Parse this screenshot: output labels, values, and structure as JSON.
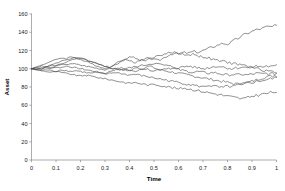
{
  "chart_data": {
    "type": "line",
    "title": "",
    "xlabel": "Time",
    "ylabel": "Asset",
    "xlim": [
      0,
      1
    ],
    "ylim": [
      0,
      160
    ],
    "grid": false,
    "legend": false,
    "x_ticks": [
      "0",
      "0.1",
      "0.2",
      "0.3",
      "0.4",
      "0.5",
      "0.6",
      "0.7",
      "0.8",
      "0.9",
      "1"
    ],
    "x_tick_values": [
      0,
      0.1,
      0.2,
      0.3,
      0.4,
      0.5,
      0.6,
      0.7,
      0.8,
      0.9,
      1
    ],
    "y_ticks": [
      "0",
      "20",
      "40",
      "60",
      "80",
      "100",
      "120",
      "140",
      "160"
    ],
    "y_tick_values": [
      0,
      20,
      40,
      60,
      80,
      100,
      120,
      140,
      160
    ],
    "line_color": "#4a4a4a",
    "x": [
      0,
      0.02,
      0.04,
      0.06,
      0.08,
      0.1,
      0.12,
      0.14,
      0.16,
      0.18,
      0.2,
      0.22,
      0.24,
      0.26,
      0.28,
      0.3,
      0.32,
      0.34,
      0.36,
      0.38,
      0.4,
      0.42,
      0.44,
      0.46,
      0.48,
      0.5,
      0.52,
      0.54,
      0.56,
      0.58,
      0.6,
      0.62,
      0.64,
      0.66,
      0.68,
      0.7,
      0.72,
      0.74,
      0.76,
      0.78,
      0.8,
      0.82,
      0.84,
      0.86,
      0.88,
      0.9,
      0.92,
      0.94,
      0.96,
      0.98,
      1
    ],
    "series": [
      {
        "name": "path-1",
        "values": [
          100,
          101,
          103,
          102,
          104,
          103,
          105,
          104,
          106,
          105,
          104,
          103,
          102,
          101,
          100,
          99,
          101,
          104,
          107,
          110,
          109,
          107,
          108,
          110,
          112,
          110,
          109,
          112,
          115,
          117,
          116,
          118,
          117,
          119,
          118,
          120,
          122,
          124,
          126,
          128,
          127,
          130,
          133,
          136,
          139,
          141,
          143,
          144,
          146,
          146,
          147
        ]
      },
      {
        "name": "path-2",
        "values": [
          100,
          102,
          104,
          106,
          108,
          110,
          112,
          111,
          113,
          112,
          110,
          108,
          106,
          104,
          102,
          100,
          102,
          105,
          108,
          111,
          113,
          112,
          110,
          109,
          111,
          113,
          114,
          116,
          117,
          118,
          117,
          116,
          115,
          116,
          114,
          113,
          112,
          110,
          109,
          108,
          107,
          106,
          105,
          104,
          103,
          101,
          100,
          99,
          98,
          97,
          96
        ]
      },
      {
        "name": "path-3",
        "values": [
          100,
          101,
          100,
          102,
          104,
          106,
          108,
          110,
          111,
          112,
          111,
          110,
          108,
          106,
          104,
          102,
          101,
          100,
          99,
          100,
          101,
          102,
          103,
          104,
          105,
          106,
          105,
          104,
          103,
          102,
          101,
          102,
          103,
          102,
          101,
          100,
          101,
          102,
          103,
          102,
          101,
          100,
          101,
          102,
          101,
          102,
          103,
          102,
          103,
          102,
          103
        ]
      },
      {
        "name": "path-4",
        "values": [
          100,
          100,
          101,
          102,
          101,
          103,
          105,
          107,
          109,
          111,
          112,
          110,
          108,
          107,
          105,
          103,
          101,
          100,
          99,
          98,
          99,
          100,
          101,
          100,
          99,
          98,
          99,
          100,
          101,
          100,
          99,
          98,
          97,
          96,
          97,
          96,
          95,
          96,
          95,
          94,
          93,
          94,
          93,
          94,
          93,
          94,
          95,
          94,
          95,
          94,
          95
        ]
      },
      {
        "name": "path-5",
        "values": [
          100,
          99,
          100,
          101,
          100,
          102,
          101,
          103,
          102,
          101,
          100,
          99,
          98,
          97,
          96,
          95,
          97,
          99,
          101,
          100,
          98,
          97,
          99,
          101,
          103,
          101,
          99,
          98,
          97,
          96,
          95,
          94,
          93,
          92,
          91,
          90,
          89,
          88,
          87,
          86,
          85,
          84,
          83,
          84,
          85,
          86,
          88,
          90,
          91,
          92,
          93
        ]
      },
      {
        "name": "path-6",
        "values": [
          100,
          99,
          98,
          99,
          98,
          97,
          99,
          98,
          97,
          98,
          97,
          96,
          95,
          96,
          95,
          94,
          95,
          96,
          95,
          94,
          93,
          94,
          93,
          92,
          91,
          90,
          89,
          88,
          87,
          86,
          85,
          84,
          83,
          82,
          81,
          80,
          82,
          81,
          80,
          79,
          81,
          80,
          82,
          83,
          84,
          85,
          86,
          87,
          88,
          89,
          90
        ]
      },
      {
        "name": "path-7",
        "values": [
          100,
          99,
          98,
          97,
          96,
          97,
          96,
          95,
          94,
          93,
          92,
          93,
          92,
          91,
          90,
          89,
          88,
          87,
          86,
          85,
          84,
          85,
          84,
          83,
          82,
          83,
          82,
          81,
          80,
          79,
          78,
          79,
          78,
          77,
          76,
          75,
          74,
          73,
          72,
          71,
          70,
          69,
          68,
          67,
          68,
          70,
          71,
          72,
          73,
          74,
          75
        ]
      }
    ]
  }
}
